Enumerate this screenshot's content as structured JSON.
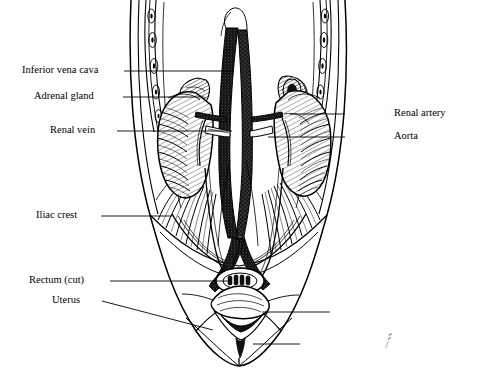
{
  "figure": {
    "style": "pen-and-ink anatomical illustration",
    "background_color": "#ffffff",
    "ink_color": "#000000",
    "signature": "artist signature"
  },
  "labels_left": [
    {
      "id": "inferior-vena-cava",
      "text": "Inferior vena cava",
      "text_x": 22,
      "text_y": 64,
      "leader_x1": 124,
      "leader_y1": 71,
      "leader_x2": 233,
      "leader_y2": 71
    },
    {
      "id": "adrenal-gland",
      "text": "Adrenal gland",
      "text_x": 34,
      "text_y": 90,
      "leader_x1": 123,
      "leader_y1": 97,
      "leader_x2": 200,
      "leader_y2": 97
    },
    {
      "id": "renal-vein",
      "text": "Renal vein",
      "text_x": 50,
      "text_y": 124,
      "leader_x1": 117,
      "leader_y1": 131,
      "leader_x2": 232,
      "leader_y2": 131
    },
    {
      "id": "iliac-crest",
      "text": "Iliac crest",
      "text_x": 36,
      "text_y": 209,
      "leader_x1": 101,
      "leader_y1": 216,
      "leader_x2": 172,
      "leader_y2": 216
    },
    {
      "id": "rectum-cut",
      "text": "Rectum (cut)",
      "text_x": 29,
      "text_y": 274,
      "leader_x1": 110,
      "leader_y1": 281,
      "leader_x2": 228,
      "leader_y2": 281
    },
    {
      "id": "uterus",
      "text": "Uterus",
      "text_x": 52,
      "text_y": 294,
      "leader_x1": 102,
      "leader_y1": 301,
      "leader_x2": 213,
      "leader_y2": 330
    }
  ],
  "labels_right": [
    {
      "id": "renal-artery",
      "text": "Renal artery",
      "text_x": 394,
      "text_y": 107,
      "leader_x1": 345,
      "leader_y1": 114,
      "leader_x2": 290,
      "leader_y2": 114
    },
    {
      "id": "aorta",
      "text": "Aorta",
      "text_x": 394,
      "text_y": 130,
      "leader_x1": 345,
      "leader_y1": 137,
      "leader_x2": 268,
      "leader_y2": 137
    }
  ],
  "unlabeled_leaders": [
    {
      "id": "bladder-leader",
      "x1": 330,
      "y1": 312,
      "x2": 262,
      "y2": 312
    },
    {
      "id": "urethra-leader",
      "x1": 300,
      "y1": 344,
      "x2": 253,
      "y2": 344
    }
  ],
  "structures": [
    "ribcage-left",
    "ribcage-right",
    "torso-outline",
    "kidney-left",
    "kidney-right",
    "adrenal-gland-left",
    "adrenal-gland-right",
    "inferior-vena-cava",
    "aorta",
    "renal-vein",
    "renal-artery",
    "ureter-left",
    "ureter-right",
    "psoas-muscle-striations",
    "iliac-crest",
    "uterus",
    "rectum-cut",
    "bladder",
    "pubic-symphysis"
  ]
}
